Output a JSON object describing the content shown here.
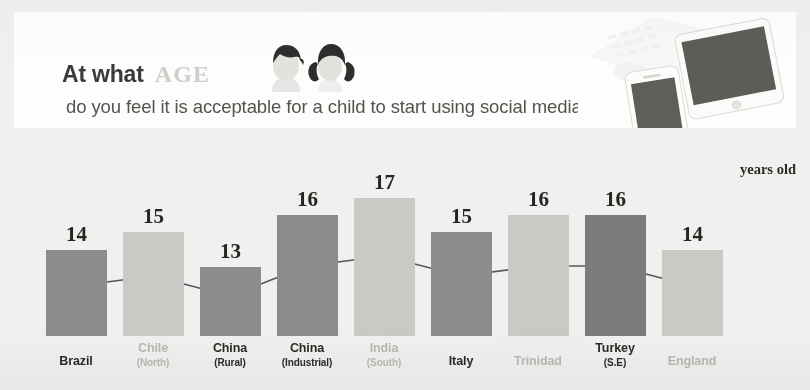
{
  "header": {
    "title_prefix": "At what",
    "title_emphasis": "AGE",
    "subtitle": "do you feel it is acceptable for a child to start using social media?",
    "avatar_boy": "boy-avatar-icon",
    "avatar_girl": "girl-avatar-icon",
    "devices_photo": "devices-photo"
  },
  "chart_data": {
    "type": "bar",
    "xlabel": "",
    "ylabel": "years old",
    "ylim": [
      0,
      17
    ],
    "grid": false,
    "legend": "none",
    "unit_note": "years old",
    "categories": [
      "Brazil",
      "Chile",
      "China",
      "China",
      "India",
      "Italy",
      "Trinidad",
      "Turkey",
      "England"
    ],
    "subcategories": [
      "",
      "(North)",
      "(Rural)",
      "(Industrial)",
      "(South)",
      "",
      "",
      "(S.E)",
      ""
    ],
    "values": [
      14,
      15,
      13,
      16,
      17,
      15,
      16,
      16,
      14
    ],
    "bar_tones": [
      "dark",
      "light",
      "dark",
      "dark",
      "light",
      "dark",
      "light",
      "dark",
      "light"
    ],
    "overlay_line": {
      "type": "line",
      "values": [
        14,
        15,
        13,
        16,
        17,
        15,
        16,
        16,
        14
      ],
      "marker": "circle"
    }
  },
  "colors": {
    "page_background": "#f1f0ee",
    "card_background": "#fdfdfc",
    "bar_dark": "#8c8c8a",
    "bar_light": "#c9c9c6",
    "bar_darkest": "#7b7b79",
    "label_dark": "#2c2b28",
    "label_light": "#b9b8b4",
    "line_stroke": "#57565a",
    "marker_fill": "#55545a",
    "title_emphasis": "#cfcecb"
  }
}
